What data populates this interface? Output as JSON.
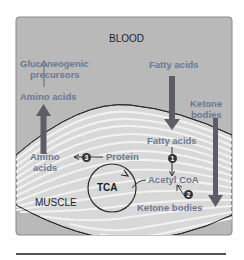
{
  "diagram": {
    "regions": {
      "blood": "BLOOD",
      "muscle": "MUSCLE"
    },
    "blood_labels": {
      "gluconeogenic": [
        "Gluconeogenic",
        "precursors"
      ],
      "amino_acids": "Amino acids",
      "fatty_acids": "Fatty acids",
      "ketone_bodies": [
        "Ketone",
        "bodies"
      ]
    },
    "muscle_labels": {
      "amino_acids": [
        "Amino",
        "acids"
      ],
      "protein": "Protein",
      "fatty_acids": "Fatty acids",
      "acetyl_coa": "Acetyl CoA",
      "ketone_bodies": "Ketone bodies",
      "tca": "TCA"
    },
    "steps": [
      "1",
      "2",
      "3"
    ],
    "colors": {
      "blood_bg": "#b9b9b9",
      "muscle_stripe_light": "#ececec",
      "muscle_stripe_dark": "#c4c4c4",
      "label_blue": "#6a7890",
      "arrow_dark": "#5d5d66",
      "text_dark": "#1f1f1f"
    }
  }
}
